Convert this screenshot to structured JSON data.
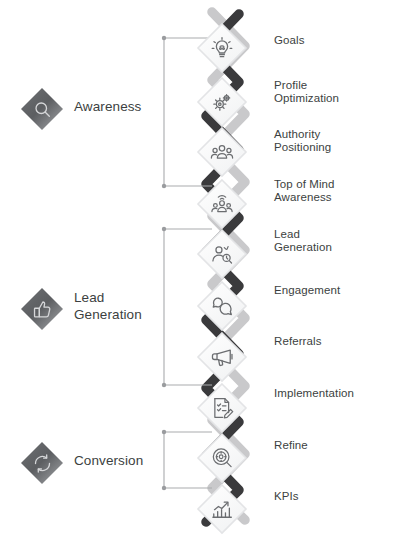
{
  "diagram": {
    "type": "zigzag-chain-infographic",
    "palette": {
      "ribbon_dark": "#3a3a3c",
      "ribbon_light": "#c9c9cb",
      "text": "#3c3f41",
      "badge_dark": "#5f6164",
      "badge_light": "#a9abae",
      "bracket": "#a9abae",
      "background": "#ffffff"
    },
    "steps": [
      {
        "n": 1,
        "label": "Goals",
        "icon": "lightbulb-icon",
        "side": "left"
      },
      {
        "n": 2,
        "label": "Profile\nOptimization",
        "icon": "gears-icon",
        "side": "right"
      },
      {
        "n": 3,
        "label": "Authority\nPositioning",
        "icon": "group-people-icon",
        "side": "left"
      },
      {
        "n": 4,
        "label": "Top of Mind\nAwareness",
        "icon": "broadcast-people-icon",
        "side": "right"
      },
      {
        "n": 5,
        "label": "Lead\nGeneration",
        "icon": "person-search-icon",
        "side": "left"
      },
      {
        "n": 6,
        "label": "Engagement",
        "icon": "chat-bubbles-icon",
        "side": "right"
      },
      {
        "n": 7,
        "label": "Referrals",
        "icon": "megaphone-icon",
        "side": "left"
      },
      {
        "n": 8,
        "label": "Implementation",
        "icon": "checklist-pencil-icon",
        "side": "right"
      },
      {
        "n": 9,
        "label": "Refine",
        "icon": "gear-magnifier-icon",
        "side": "left"
      },
      {
        "n": 10,
        "label": "KPIs",
        "icon": "bar-chart-arrow-icon",
        "side": "right"
      }
    ],
    "groups": [
      {
        "id": "awareness",
        "label": "Awareness",
        "icon": "magnifier-diamond-icon",
        "steps": [
          1,
          2,
          3,
          4
        ]
      },
      {
        "id": "lead-generation",
        "label": "Lead\nGeneration",
        "icon": "thumbs-up-diamond-icon",
        "steps": [
          5,
          6,
          7,
          8
        ]
      },
      {
        "id": "conversion",
        "label": "Conversion",
        "icon": "refresh-cycle-diamond-icon",
        "steps": [
          9,
          10
        ]
      }
    ]
  }
}
